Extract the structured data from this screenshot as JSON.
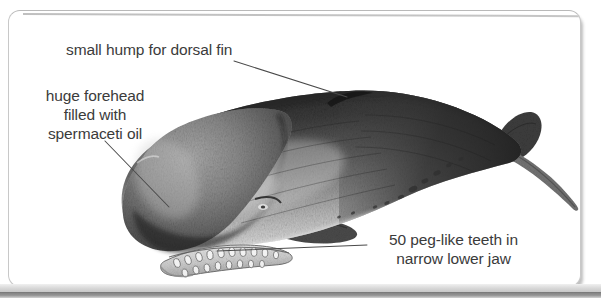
{
  "figure": {
    "medium": "graphite pencil drawing",
    "background_color": "#ffffff",
    "text_color": "#3b3b3b",
    "leader_line_color": "#4a4a4a"
  },
  "callouts": {
    "dorsal": {
      "text": "small hump for dorsal fin",
      "lines": [
        "small hump for dorsal fin"
      ]
    },
    "forehead": {
      "text": "huge forehead filled with spermaceti oil",
      "lines": [
        "huge forehead",
        "filled with",
        "spermaceti oil"
      ]
    },
    "teeth": {
      "text": "50 peg-like teeth in narrow lower jaw",
      "lines": [
        "50 peg-like teeth in",
        "narrow lower jaw"
      ],
      "count": "50"
    }
  }
}
